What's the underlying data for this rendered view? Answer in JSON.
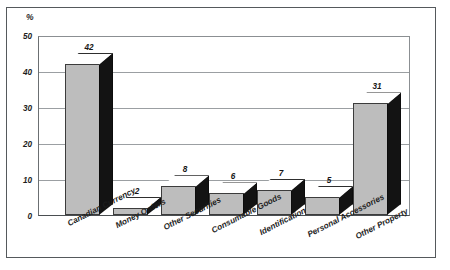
{
  "chart_data": {
    "type": "bar",
    "title": "",
    "subtitle": "",
    "xlabel": "",
    "ylabel": "%",
    "ylim": [
      0,
      50
    ],
    "yticks": [
      0,
      10,
      20,
      30,
      40,
      50
    ],
    "grid": true,
    "legend": null,
    "style": "3d-column",
    "categories": [
      "Canadian Currency",
      "Money Orders",
      "Other Securities",
      "Consumable Goods",
      "Identification",
      "Personal Accessories",
      "Other Property"
    ],
    "values": [
      42,
      2,
      8,
      6,
      7,
      5,
      31
    ],
    "data_labels": [
      "42",
      "2",
      "8",
      "6",
      "7",
      "5",
      "31"
    ],
    "colors": {
      "bar_front": "#bdbdbd",
      "bar_side": "#131313",
      "bar_top": "#ffffff",
      "gridline": "#9b9fa2",
      "axis": "#4a4e51",
      "text": "#1d1d1d",
      "frame": "#55595c",
      "background": "#ffffff"
    }
  },
  "axis": {
    "unit_label": "%",
    "tick_labels": [
      "50",
      "40",
      "30",
      "20",
      "10",
      "0"
    ]
  }
}
